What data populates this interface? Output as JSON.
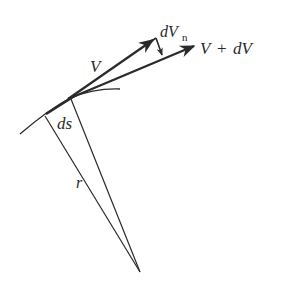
{
  "diagram": {
    "colors": {
      "stroke": "#2a2a2a",
      "background": "#ffffff"
    },
    "labels": {
      "v": "V",
      "dvn_main": "dV",
      "dvn_sub": "n",
      "v_plus_dv_v1": "V",
      "v_plus_dv_plus": "+",
      "v_plus_dv_dv": "dV",
      "ds": "ds",
      "r": "r"
    },
    "elements": [
      {
        "name": "path-arc",
        "type": "curve"
      },
      {
        "name": "vector-v",
        "type": "arrow"
      },
      {
        "name": "vector-v-plus-dv",
        "type": "arrow"
      },
      {
        "name": "vector-dvn",
        "type": "arrow"
      },
      {
        "name": "radius-line-1",
        "type": "line"
      },
      {
        "name": "radius-line-2",
        "type": "line"
      }
    ]
  }
}
